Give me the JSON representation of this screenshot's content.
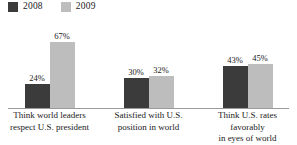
{
  "chart_data": {
    "type": "bar",
    "title": "",
    "subtitle": "",
    "xlabel": "",
    "ylabel": "",
    "ylim": [
      0,
      75
    ],
    "grid": false,
    "legend_position": "top-left",
    "categories": [
      "Think world leaders respect U.S. president",
      "Satisfied with U.S. position in world",
      "Think U.S. rates favorably in eyes of world"
    ],
    "category_lines": [
      [
        "Think world leaders",
        "respect U.S. president"
      ],
      [
        "Satisfied with U.S.",
        "position in world"
      ],
      [
        "Think U.S. rates favorably",
        "in eyes of world"
      ]
    ],
    "series": [
      {
        "name": "2008",
        "color": "#3b3b3b",
        "values": [
          24,
          30,
          43
        ],
        "labels": [
          "24%",
          "30%",
          "32%-placeholder"
        ]
      },
      {
        "name": "2009",
        "color": "#bdbdbd",
        "values": [
          67,
          32,
          45
        ],
        "labels": [
          "67%",
          "32%",
          "45%"
        ]
      }
    ],
    "bars": [
      {
        "category_index": 0,
        "points": [
          {
            "series": "2008",
            "value": 24,
            "label": "24%",
            "color": "#3b3b3b"
          },
          {
            "series": "2009",
            "value": 67,
            "label": "67%",
            "color": "#bdbdbd"
          }
        ]
      },
      {
        "category_index": 1,
        "points": [
          {
            "series": "2008",
            "value": 30,
            "label": "30%",
            "color": "#3b3b3b"
          },
          {
            "series": "2009",
            "value": 32,
            "label": "32%",
            "color": "#bdbdbd"
          }
        ]
      },
      {
        "category_index": 2,
        "points": [
          {
            "series": "2008",
            "value": 43,
            "label": "43%",
            "color": "#3b3b3b"
          },
          {
            "series": "2009",
            "value": 45,
            "label": "45%",
            "color": "#bdbdbd"
          }
        ]
      }
    ]
  },
  "legend": {
    "items": [
      {
        "label": "2008",
        "color": "#3b3b3b"
      },
      {
        "label": "2009",
        "color": "#bdbdbd"
      }
    ]
  },
  "axis": {
    "baseline_color": "#9a9a9a"
  },
  "colors": {
    "series_2008": "#3b3b3b",
    "series_2009": "#bdbdbd",
    "text": "#1a1a1a",
    "background": "#ffffff",
    "axis": "#9a9a9a"
  }
}
